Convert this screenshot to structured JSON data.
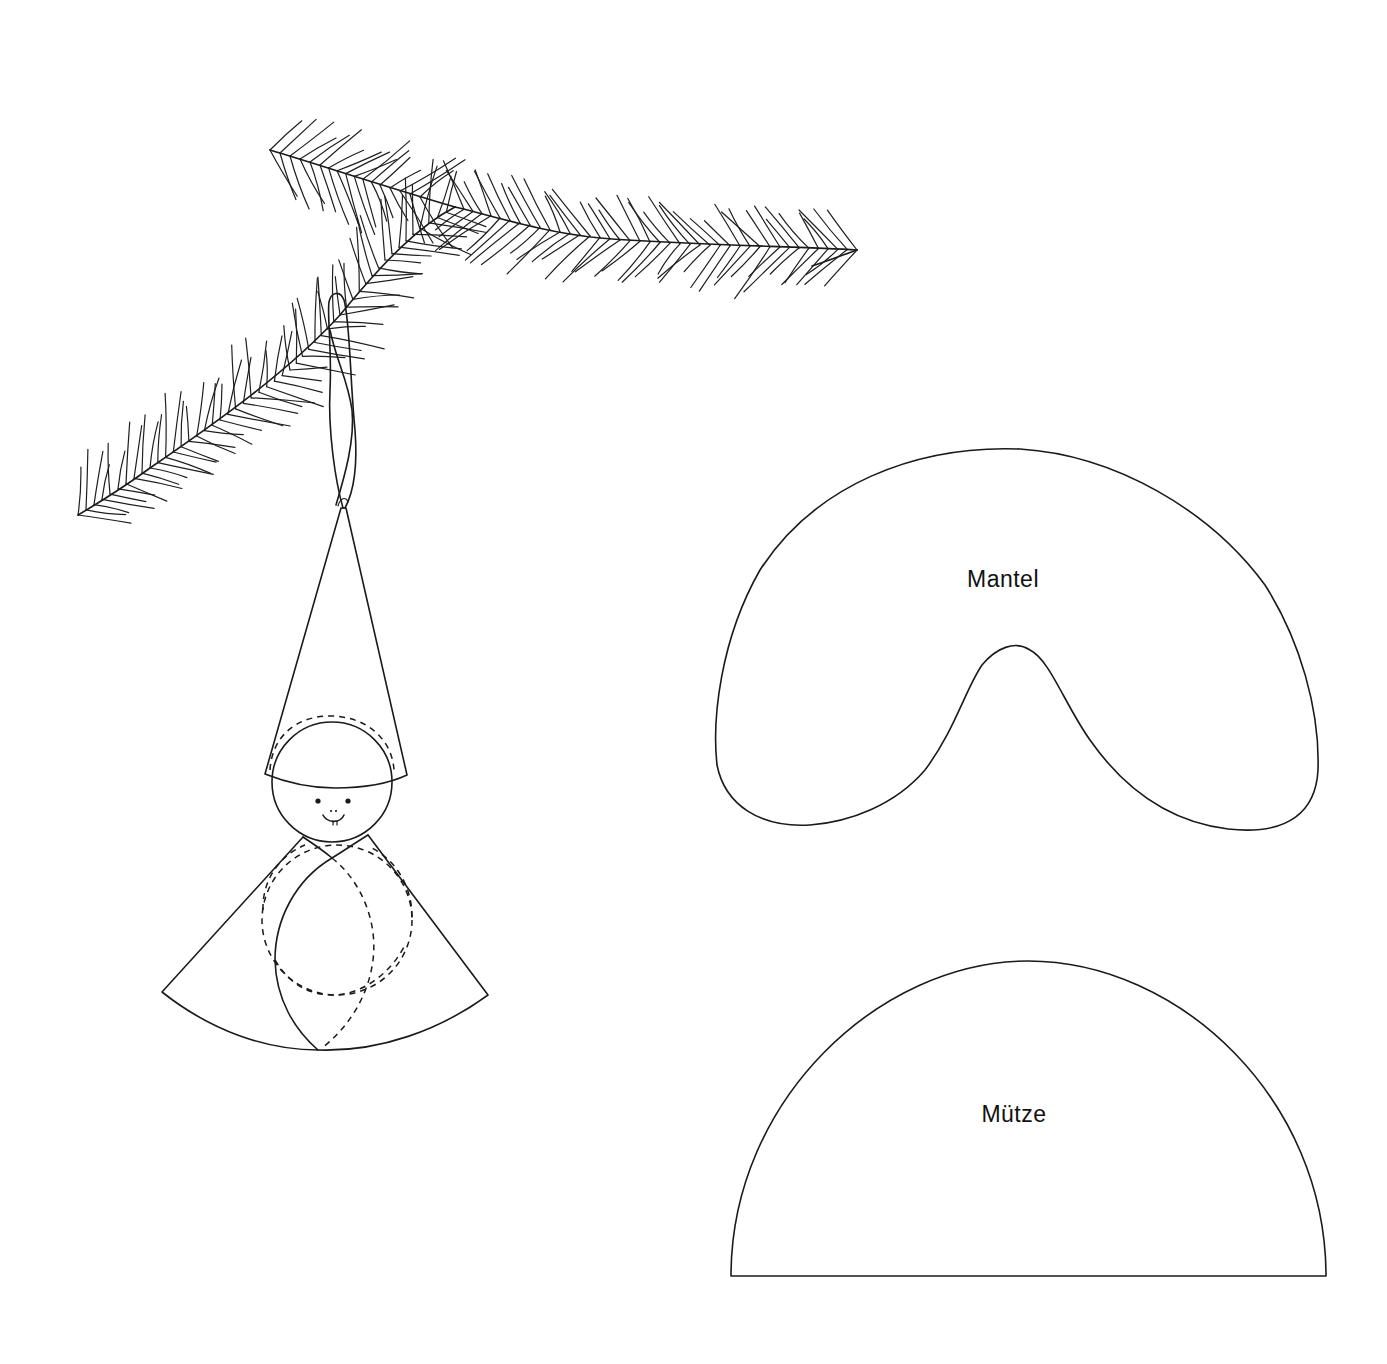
{
  "illustration": {
    "subject": "paper gnome ornament hanging on fir branch",
    "parts": [
      "fir-branch",
      "hanging-loop",
      "hat-cone",
      "head",
      "coat-cone",
      "body-ball"
    ]
  },
  "templates": [
    {
      "id": "mantel",
      "label": "Mantel",
      "shape": "kidney / crescent coat pattern"
    },
    {
      "id": "muetze",
      "label": "Mütze",
      "shape": "semicircle hat pattern"
    }
  ],
  "colors": {
    "ink": "#1a1a1a",
    "paper": "#ffffff"
  }
}
